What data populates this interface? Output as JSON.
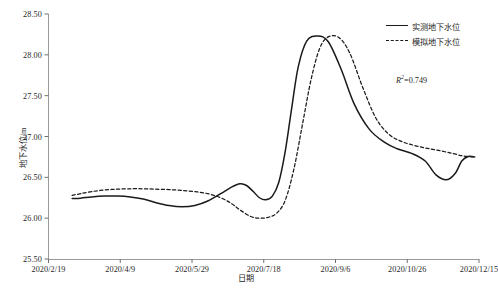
{
  "chart_data": {
    "type": "line",
    "title": "",
    "xlabel": "日期",
    "ylabel": "地下水位/m",
    "ylim": [
      25.5,
      28.5
    ],
    "ytick_labels": [
      "28.50",
      "28.00",
      "27.50",
      "27.00",
      "26.50",
      "26.00",
      "25.50"
    ],
    "ytick_values": [
      28.5,
      28.0,
      27.5,
      27.0,
      26.5,
      26.0,
      25.5
    ],
    "xtick_labels": [
      "2020/2/19",
      "2020/4/9",
      "2020/5/29",
      "2020/7/18",
      "2020/9/6",
      "2020/10/26",
      "2020/12/15"
    ],
    "xlim_labels": [
      "2020/2/19",
      "2020/12/15"
    ],
    "grid": false,
    "legend_position": "top-right",
    "annotations": [
      {
        "name": "r-squared",
        "label": "R",
        "superscript": "2",
        "equals": "=",
        "value": "0.749"
      }
    ],
    "series": [
      {
        "name": "实测地下水位",
        "style": "solid",
        "color": "#1a1a1a",
        "x": [
          0.055,
          0.075,
          0.1,
          0.13,
          0.16,
          0.19,
          0.22,
          0.25,
          0.28,
          0.31,
          0.34,
          0.37,
          0.4,
          0.425,
          0.445,
          0.46,
          0.475,
          0.49,
          0.505,
          0.52,
          0.535,
          0.55,
          0.565,
          0.58,
          0.6,
          0.625,
          0.65,
          0.68,
          0.71,
          0.745,
          0.78,
          0.81,
          0.845,
          0.875,
          0.9,
          0.925,
          0.945,
          0.96,
          0.975,
          0.99
        ],
        "values": [
          26.24,
          26.245,
          26.26,
          26.27,
          26.27,
          26.26,
          26.235,
          26.19,
          26.155,
          26.14,
          26.155,
          26.21,
          26.3,
          26.38,
          26.42,
          26.4,
          26.33,
          26.25,
          26.225,
          26.27,
          26.44,
          26.82,
          27.35,
          27.85,
          28.17,
          28.23,
          28.16,
          27.82,
          27.4,
          27.09,
          26.93,
          26.85,
          26.79,
          26.7,
          26.53,
          26.47,
          26.55,
          26.7,
          26.755,
          26.75
        ]
      },
      {
        "name": "模拟地下水位",
        "style": "dashed",
        "color": "#1a1a1a",
        "x": [
          0.055,
          0.075,
          0.1,
          0.13,
          0.16,
          0.19,
          0.22,
          0.25,
          0.28,
          0.31,
          0.34,
          0.37,
          0.4,
          0.425,
          0.445,
          0.47,
          0.49,
          0.51,
          0.53,
          0.55,
          0.57,
          0.59,
          0.61,
          0.63,
          0.65,
          0.675,
          0.7,
          0.73,
          0.76,
          0.79,
          0.82,
          0.85,
          0.88,
          0.91,
          0.94,
          0.965,
          0.99
        ],
        "values": [
          26.28,
          26.3,
          26.325,
          26.345,
          26.355,
          26.36,
          26.36,
          26.355,
          26.35,
          26.34,
          26.325,
          26.3,
          26.25,
          26.18,
          26.1,
          26.02,
          26.0,
          26.01,
          26.06,
          26.22,
          26.6,
          27.15,
          27.7,
          28.08,
          28.22,
          28.21,
          28.02,
          27.6,
          27.23,
          27.03,
          26.94,
          26.89,
          26.855,
          26.825,
          26.79,
          26.76,
          26.75
        ]
      }
    ]
  },
  "axes": {
    "y_axis_title": "地下水位/m",
    "x_axis_title": "日期"
  },
  "legend": {
    "items": [
      {
        "label": "实测地下水位",
        "style": "solid"
      },
      {
        "label": "模拟地下水位",
        "style": "dashed"
      }
    ]
  },
  "caption": {
    "text": ""
  }
}
